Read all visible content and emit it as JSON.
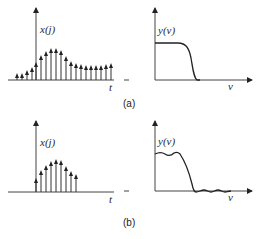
{
  "figure": {
    "panels": [
      {
        "id": "a",
        "caption": "(a)",
        "time_plot": {
          "ylabel": "x(j)",
          "xlabel": "t",
          "stems": [
            {
              "x": 17,
              "top": 73
            },
            {
              "x": 22,
              "top": 73
            },
            {
              "x": 27,
              "top": 70
            },
            {
              "x": 32,
              "top": 67
            },
            {
              "x": 36,
              "top": 62
            },
            {
              "x": 41,
              "top": 55
            },
            {
              "x": 46,
              "top": 51
            },
            {
              "x": 51,
              "top": 48
            },
            {
              "x": 56,
              "top": 48
            },
            {
              "x": 61,
              "top": 50
            },
            {
              "x": 66,
              "top": 56
            },
            {
              "x": 71,
              "top": 61
            },
            {
              "x": 76,
              "top": 63
            },
            {
              "x": 81,
              "top": 64
            },
            {
              "x": 86,
              "top": 65
            },
            {
              "x": 91,
              "top": 65
            },
            {
              "x": 96,
              "top": 65
            },
            {
              "x": 101,
              "top": 65
            },
            {
              "x": 106,
              "top": 64
            },
            {
              "x": 111,
              "top": 63
            }
          ]
        },
        "freq_plot": {
          "ylabel": "y(v)",
          "xlabel": "v",
          "shape": "smooth low-pass response"
        }
      },
      {
        "id": "b",
        "caption": "(b)",
        "time_plot": {
          "ylabel": "x(j)",
          "xlabel": "t",
          "stems": [
            {
              "x": 36,
              "top": 178
            },
            {
              "x": 41,
              "top": 170
            },
            {
              "x": 46,
              "top": 165
            },
            {
              "x": 51,
              "top": 161
            },
            {
              "x": 56,
              "top": 159
            },
            {
              "x": 61,
              "top": 160
            },
            {
              "x": 66,
              "top": 166
            },
            {
              "x": 71,
              "top": 171
            },
            {
              "x": 76,
              "top": 174
            }
          ]
        },
        "freq_plot": {
          "ylabel": "y(v)",
          "xlabel": "v",
          "shape": "low-pass response with passband and stopband ripple"
        }
      }
    ]
  }
}
